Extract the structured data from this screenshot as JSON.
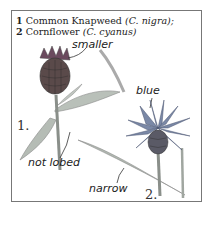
{
  "caption": {
    "line1": {
      "number": "1",
      "name": "Common Knapweed",
      "latin": "(C. nigra);"
    },
    "line2": {
      "number": "2",
      "name": "Cornflower",
      "latin": "(C. cyanus)"
    }
  },
  "annotations": {
    "smaller": "smaller",
    "not_lobed": "not lobed",
    "blue": "blue",
    "narrow": "narrow"
  },
  "figure_numbers": {
    "knapweed": "1.",
    "cornflower": "2."
  },
  "colors": {
    "frame": "#777777",
    "ink": "#222222",
    "knapweed_head": "#5a4a4a",
    "knapweed_florets": "#6b4a5e",
    "cornflower_petals": "#6f7fa0",
    "leaf": "#9aa39a"
  }
}
